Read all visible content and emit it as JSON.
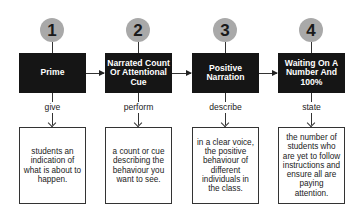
{
  "diagram": {
    "steps": [
      {
        "number": "1",
        "title": "Prime",
        "verb": "give",
        "description": "students an indication of what is about to happen."
      },
      {
        "number": "2",
        "title": "Narrated Count Or Attentional Cue",
        "verb": "perform",
        "description": "a count or cue describing the behaviour you want to see."
      },
      {
        "number": "3",
        "title": "Positive Narration",
        "verb": "describe",
        "description": "in a clear voice, the positive behaviour of different individuals in the class."
      },
      {
        "number": "4",
        "title": "Waiting On A Number And 100%",
        "verb": "state",
        "description": "the number of students who are yet to follow instructions and ensure all are paying attention."
      }
    ],
    "colors": {
      "circle": "#a9a9a9",
      "head_box": "#151515",
      "head_text": "#ffffff",
      "lines": "#333333"
    }
  }
}
